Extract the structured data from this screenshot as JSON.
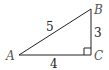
{
  "diagram": {
    "type": "right-triangle",
    "vertices": [
      {
        "id": "A",
        "label": "A"
      },
      {
        "id": "B",
        "label": "B"
      },
      {
        "id": "C",
        "label": "C"
      }
    ],
    "sides": [
      {
        "id": "AB",
        "label": "5"
      },
      {
        "id": "BC",
        "label": "3"
      },
      {
        "id": "AC",
        "label": "4"
      }
    ],
    "right_angle_at": "C",
    "colors": {
      "stroke": "#222222",
      "vertex_label": "#555555"
    }
  }
}
